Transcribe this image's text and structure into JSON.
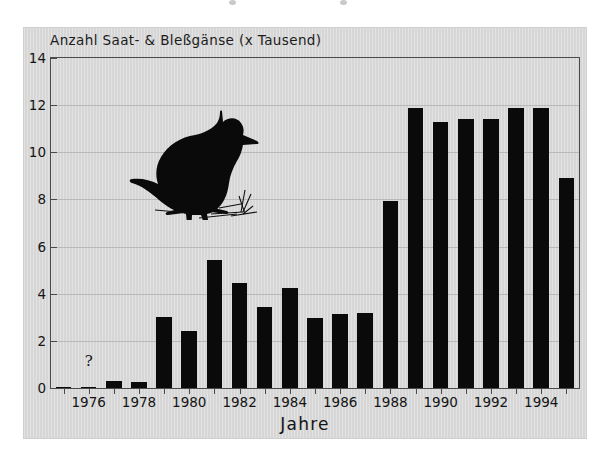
{
  "figure": {
    "title": "Anzahl Saat- & Bleßgänse (x Tausend)",
    "x_axis_title": "Jahre",
    "annotation_question": "?",
    "goose_icon_name": "goose-silhouette-icon",
    "panel_background": "#d6d6d6",
    "bar_color": "#0a0a0a",
    "axis_color": "#4a4a4a",
    "grid_color": "#b9b9b9"
  },
  "chart_data": {
    "type": "bar",
    "title": "Anzahl Saat- & Bleßgänse (x Tausend)",
    "xlabel": "Jahre",
    "ylabel": "",
    "ylim": [
      0,
      14
    ],
    "yticks": [
      0,
      2,
      4,
      6,
      8,
      10,
      12,
      14
    ],
    "ytick_labels": [
      "0",
      "2",
      "4",
      "6",
      "8",
      "10",
      "12",
      "14"
    ],
    "xtick_labels": [
      "1976",
      "1978",
      "1980",
      "1982",
      "1984",
      "1986",
      "1988",
      "1990",
      "1992",
      "1994"
    ],
    "xticks": [
      1976,
      1978,
      1980,
      1982,
      1984,
      1986,
      1988,
      1990,
      1992,
      1994
    ],
    "grid": true,
    "legend": null,
    "categories": [
      1975,
      1976,
      1977,
      1978,
      1979,
      1980,
      1981,
      1982,
      1983,
      1984,
      1985,
      1986,
      1987,
      1988,
      1989,
      1990,
      1991,
      1992,
      1993,
      1994,
      1995
    ],
    "values": [
      0.05,
      0.05,
      0.3,
      0.25,
      3.0,
      2.4,
      5.45,
      4.45,
      3.45,
      4.25,
      2.95,
      3.15,
      3.2,
      7.95,
      11.9,
      11.3,
      11.4,
      11.4,
      11.9,
      11.9,
      8.9
    ],
    "annotations": [
      {
        "text": "?",
        "x": 1976,
        "y": 1.2
      }
    ]
  }
}
